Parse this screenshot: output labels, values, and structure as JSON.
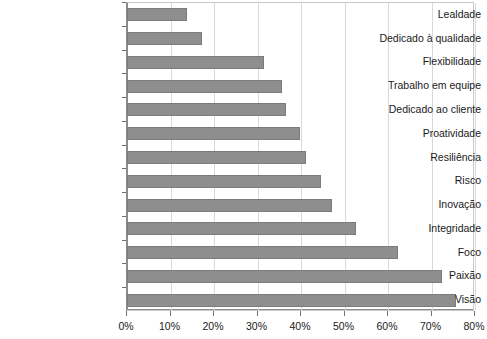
{
  "chart_data": {
    "type": "bar",
    "orientation": "horizontal",
    "title": "",
    "subtitle": "",
    "xlabel": "",
    "ylabel": "",
    "xlim": [
      0,
      80
    ],
    "xticks": [
      0,
      10,
      20,
      30,
      40,
      50,
      60,
      70,
      80
    ],
    "xtick_labels": [
      "0%",
      "10%",
      "20%",
      "30%",
      "40%",
      "50%",
      "60%",
      "70%",
      "80%"
    ],
    "grid": "vertical",
    "legend": "none",
    "value_unit": "%",
    "bar_color": "#8e8e8e",
    "bar_edge_color": "#7b7b7b",
    "gridline_color": "#d9d9d9",
    "axis_color": "#8c8c8c",
    "background_color": "#ffffff",
    "categories": [
      "Lealdade",
      "Dedicado à qualidade",
      "Flexibilidade",
      "Trabalho em equipe",
      "Dedicado ao cliente",
      "Proatividade",
      "Resiliência",
      "Risco",
      "Inovação",
      "Integridade",
      "Foco",
      "Paixão",
      "Visão"
    ],
    "values": [
      13.7,
      17.3,
      31.5,
      35.7,
      36.6,
      39.8,
      41.1,
      44.7,
      47.2,
      52.6,
      62.2,
      72.5,
      75.7
    ]
  }
}
